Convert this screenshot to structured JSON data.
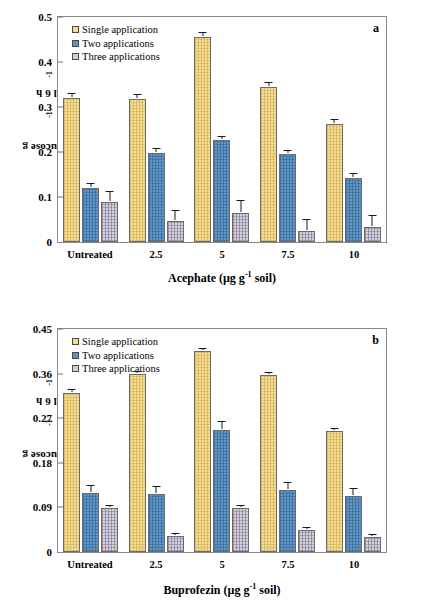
{
  "figure": {
    "panels": [
      "a",
      "b"
    ]
  },
  "panel_a": {
    "label": "a",
    "ylabel_main": "mg glucose g",
    "ylabel_sup1": "-1",
    "ylabel_mid": " soil 6 h",
    "ylabel_sup2": "-1",
    "xtitle_main": "Acephate (µg g",
    "xtitle_sup": "-1",
    "xtitle_tail": " soil)",
    "yticks": [
      "0",
      "0.1",
      "0.2",
      "0.3",
      "0.4",
      "0.5"
    ],
    "categories": [
      "Untreated",
      "2.5",
      "5",
      "7.5",
      "10"
    ],
    "legend": [
      {
        "label": "Single application",
        "color": "#f4dc92"
      },
      {
        "label": "Two applications",
        "color": "#5e95c6"
      },
      {
        "label": "Three applications",
        "color": "#d5d0de"
      }
    ]
  },
  "panel_b": {
    "label": "b",
    "ylabel_main": "mg glucose g",
    "ylabel_sup1": "-1",
    "ylabel_mid": " soil 6 h",
    "ylabel_sup2": "-1",
    "xtitle_main": "Buprofezin (µg g",
    "xtitle_sup": "-1",
    "xtitle_tail": " soil)",
    "yticks": [
      "0",
      "0.09",
      "0.18",
      "0.27",
      "0.36",
      "0.45"
    ],
    "categories": [
      "Untreated",
      "2.5",
      "5",
      "7.5",
      "10"
    ],
    "legend": [
      {
        "label": "Single application",
        "color": "#f4dc92"
      },
      {
        "label": "Two applications",
        "color": "#5e95c6"
      },
      {
        "label": "Three applications",
        "color": "#d5d0de"
      }
    ]
  },
  "chart_data": [
    {
      "type": "bar",
      "panel": "a",
      "title": "",
      "xlabel": "Acephate (µg g-1 soil)",
      "ylabel": "mg glucose g-1 soil 6 h-1",
      "ylim": [
        0,
        0.5
      ],
      "ytick_values": [
        0,
        0.1,
        0.2,
        0.3,
        0.4,
        0.5
      ],
      "grid": false,
      "legend_position": "top-left",
      "categories": [
        "Untreated",
        "2.5",
        "5",
        "7.5",
        "10"
      ],
      "series": [
        {
          "name": "Single application",
          "color": "#f4dc92",
          "values": [
            0.32,
            0.318,
            0.456,
            0.345,
            0.263
          ],
          "errors": [
            0.009,
            0.009,
            0.009,
            0.008,
            0.009
          ]
        },
        {
          "name": "Two applications",
          "color": "#5e95c6",
          "values": [
            0.12,
            0.198,
            0.227,
            0.195,
            0.143
          ],
          "errors": [
            0.008,
            0.008,
            0.007,
            0.007,
            0.008
          ]
        },
        {
          "name": "Three applications",
          "color": "#d5d0de",
          "values": [
            0.089,
            0.047,
            0.065,
            0.025,
            0.033
          ],
          "errors": [
            0.022,
            0.022,
            0.026,
            0.023,
            0.024
          ]
        }
      ]
    },
    {
      "type": "bar",
      "panel": "b",
      "title": "",
      "xlabel": "Buprofezin (µg g-1 soil)",
      "ylabel": "mg glucose g-1 soil 6 h-1",
      "ylim": [
        0,
        0.45
      ],
      "ytick_values": [
        0,
        0.09,
        0.18,
        0.27,
        0.36,
        0.45
      ],
      "grid": false,
      "legend_position": "top-left",
      "categories": [
        "Untreated",
        "2.5",
        "5",
        "7.5",
        "10"
      ],
      "series": [
        {
          "name": "Single application",
          "color": "#f4dc92",
          "values": [
            0.32,
            0.359,
            0.405,
            0.357,
            0.245
          ],
          "errors": [
            0.006,
            0.004,
            0.004,
            0.004,
            0.004
          ]
        },
        {
          "name": "Two applications",
          "color": "#5e95c6",
          "values": [
            0.12,
            0.118,
            0.247,
            0.125,
            0.113
          ],
          "errors": [
            0.013,
            0.014,
            0.015,
            0.015,
            0.015
          ]
        },
        {
          "name": "Three applications",
          "color": "#d5d0de",
          "values": [
            0.089,
            0.033,
            0.088,
            0.045,
            0.031
          ],
          "errors": [
            0.004,
            0.003,
            0.004,
            0.004,
            0.003
          ]
        }
      ]
    }
  ]
}
